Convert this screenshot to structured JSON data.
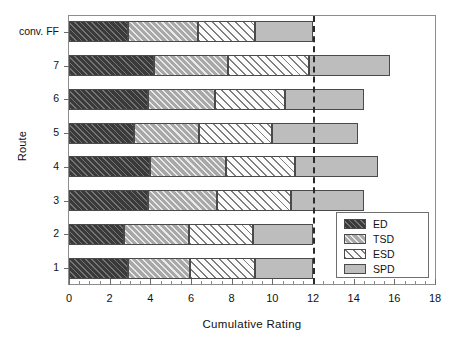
{
  "chart_data": {
    "type": "bar",
    "orientation": "horizontal",
    "stacked": true,
    "title": "",
    "xlabel": "Cumulative Rating",
    "ylabel": "Route",
    "xlim": [
      0,
      18
    ],
    "xticks": [
      0,
      2,
      4,
      6,
      8,
      10,
      12,
      14,
      16,
      18
    ],
    "xtick_labels": [
      "0",
      "2",
      "4",
      "6",
      "8",
      "10",
      "12",
      "14",
      "16",
      "18"
    ],
    "minor_tick_step": 0.5,
    "grid": false,
    "legend_position": "lower right",
    "categories": [
      "conv. FF",
      "7",
      "6",
      "5",
      "4",
      "3",
      "2",
      "1"
    ],
    "series": [
      {
        "name": "ED",
        "values": [
          2.9,
          4.2,
          3.9,
          3.2,
          4.0,
          3.9,
          2.7,
          2.9
        ]
      },
      {
        "name": "TSD",
        "values": [
          3.45,
          3.6,
          3.3,
          3.2,
          3.7,
          3.4,
          3.2,
          3.05
        ]
      },
      {
        "name": "ESD",
        "values": [
          2.8,
          4.0,
          3.4,
          3.6,
          3.4,
          3.6,
          3.15,
          3.2
        ]
      },
      {
        "name": "SPD",
        "values": [
          2.85,
          4.0,
          3.9,
          4.2,
          4.1,
          3.6,
          2.95,
          2.85
        ]
      }
    ],
    "totals": [
      12.0,
      15.8,
      14.5,
      14.2,
      15.2,
      14.5,
      12.0,
      12.0
    ],
    "annotations": [
      {
        "type": "vline",
        "value": 12,
        "style": "dashed",
        "color": "#2a2a2a"
      }
    ],
    "series_styles": [
      {
        "name": "ED",
        "fill": "#3a3a3a",
        "hatch": "diagonal-dense",
        "edge": "#4a4a4a"
      },
      {
        "name": "TSD",
        "fill": "#a8a8a8",
        "hatch": "diagonal-light",
        "edge": "#4a4a4a"
      },
      {
        "name": "ESD",
        "fill": "#fbfbfb",
        "hatch": "diagonal-open",
        "edge": "#4a4a4a"
      },
      {
        "name": "SPD",
        "fill": "#bdbdbd",
        "hatch": "none",
        "edge": "#4a4a4a"
      }
    ]
  },
  "legend": {
    "items": [
      {
        "label": "ED"
      },
      {
        "label": "TSD"
      },
      {
        "label": "ESD"
      },
      {
        "label": "SPD"
      }
    ]
  }
}
